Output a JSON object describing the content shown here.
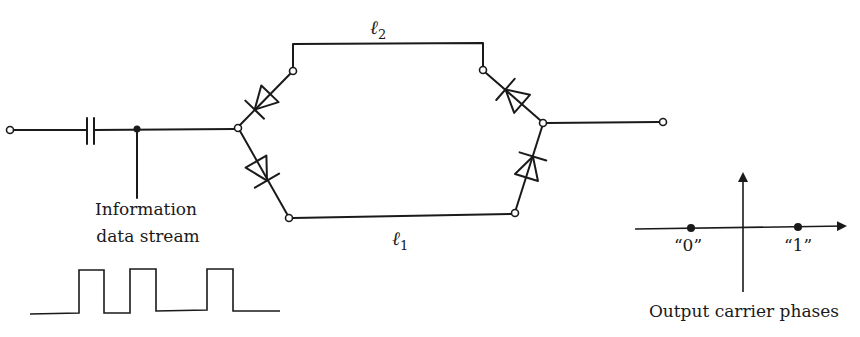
{
  "diagram": {
    "title": "",
    "labels": {
      "path_upper": "ℓ",
      "path_upper_sub": "2",
      "path_lower": "ℓ",
      "path_lower_sub": "1",
      "input_caption_line1": "Information",
      "input_caption_line2": "data stream",
      "phase_caption": "Output carrier phases",
      "phase_zero": "“0”",
      "phase_one": "“1”"
    },
    "components": [
      {
        "type": "terminal",
        "name": "input-terminal"
      },
      {
        "type": "capacitor",
        "name": "dc-block-capacitor"
      },
      {
        "type": "junction",
        "name": "data-injection-node"
      },
      {
        "type": "diode",
        "name": "diode-upper-left"
      },
      {
        "type": "diode",
        "name": "diode-lower-left"
      },
      {
        "type": "transmission-line",
        "name": "line-l2",
        "label": "ℓ2"
      },
      {
        "type": "transmission-line",
        "name": "line-l1",
        "label": "ℓ1"
      },
      {
        "type": "diode",
        "name": "diode-upper-right"
      },
      {
        "type": "diode",
        "name": "diode-lower-right"
      },
      {
        "type": "terminal",
        "name": "output-terminal"
      }
    ],
    "data_stream": {
      "bits": [
        0,
        1,
        0,
        1,
        0,
        0,
        1,
        0
      ]
    },
    "constellation": {
      "points": [
        {
          "label": "“0”",
          "phase_deg": 180
        },
        {
          "label": "“1”",
          "phase_deg": 0
        }
      ]
    },
    "colors": {
      "ink": "#1a1a1a",
      "background": "#ffffff"
    }
  }
}
